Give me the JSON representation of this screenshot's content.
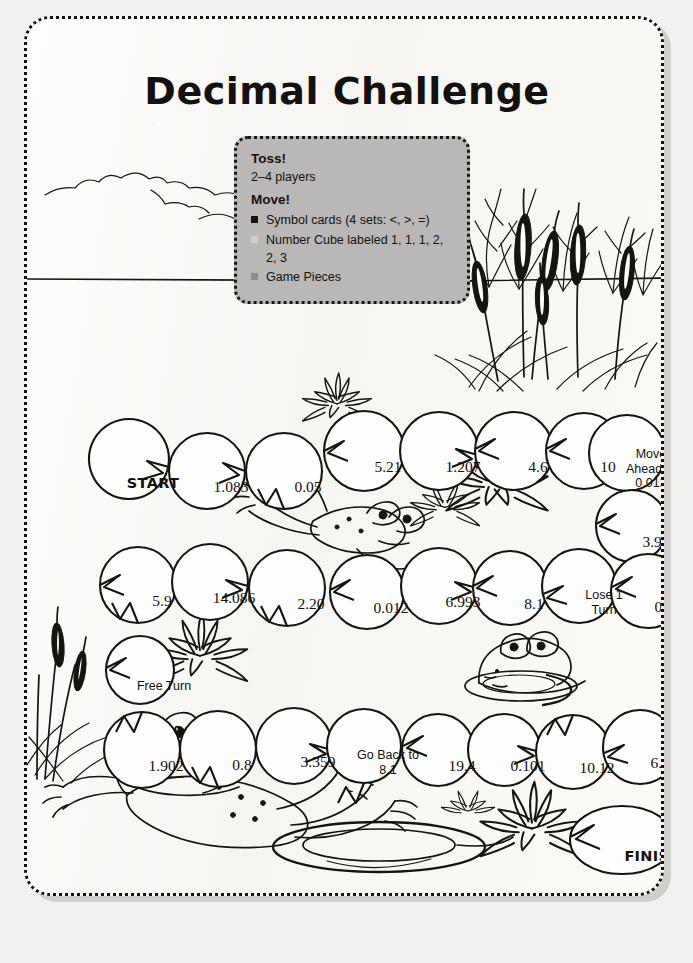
{
  "page": {
    "title": "Decimal Challenge",
    "background_color": "#f2f1ef",
    "sheet_color": "#fbfbf9",
    "ink_color": "#17130f"
  },
  "rules_box": {
    "accent_color": "#b9b8b6",
    "toss_heading": "Toss!",
    "players": "2–4 players",
    "move_heading": "Move!",
    "items": [
      {
        "icon": "square-bullet-dark",
        "text": "Symbol cards (4 sets: <, >, =)"
      },
      {
        "icon": "square-bullet-light",
        "text": "Number Cube labeled 1, 1, 1, 2, 2, 3"
      },
      {
        "icon": "square-bullet-grey",
        "text": "Game Pieces"
      }
    ]
  },
  "board": {
    "start_label": "START",
    "finish_label": "FINISH",
    "rows": [
      {
        "name": "row-1",
        "spaces": [
          {
            "label": "START",
            "kind": "start",
            "x": 102,
            "y": 448
          },
          {
            "label": "1.083",
            "kind": "number",
            "x": 180,
            "y": 452
          },
          {
            "label": "0.05",
            "kind": "number",
            "x": 257,
            "y": 452
          },
          {
            "label": "5.21",
            "kind": "number",
            "x": 337,
            "y": 432
          },
          {
            "label": "1.207",
            "kind": "number",
            "x": 412,
            "y": 432
          },
          {
            "label": "4.6",
            "kind": "number",
            "x": 487,
            "y": 432
          },
          {
            "label": "10",
            "kind": "number",
            "x": 557,
            "y": 432
          },
          {
            "label": "Move Ahead to 0.012",
            "kind": "instruction",
            "x": 624,
            "y": 434
          },
          {
            "label": "3.97",
            "kind": "number",
            "x": 627,
            "y": 507
          }
        ]
      },
      {
        "name": "row-2",
        "spaces": [
          {
            "label": "5.9",
            "kind": "number",
            "x": 111,
            "y": 566
          },
          {
            "label": "14.086",
            "kind": "number",
            "x": 183,
            "y": 563
          },
          {
            "label": "2.20",
            "kind": "number",
            "x": 260,
            "y": 569
          },
          {
            "label": "0.012",
            "kind": "number",
            "x": 340,
            "y": 573
          },
          {
            "label": "6.993",
            "kind": "number",
            "x": 412,
            "y": 567
          },
          {
            "label": "8.1",
            "kind": "number",
            "x": 483,
            "y": 569
          },
          {
            "label": "Lose 1 Turn",
            "kind": "instruction",
            "x": 552,
            "y": 567
          },
          {
            "label": "0.003",
            "kind": "number",
            "x": 621,
            "y": 572
          },
          {
            "label": "Free Turn",
            "kind": "instruction",
            "x": 113,
            "y": 651
          }
        ]
      },
      {
        "name": "row-3",
        "spaces": [
          {
            "label": "1.902",
            "kind": "number",
            "x": 115,
            "y": 731
          },
          {
            "label": "0.8",
            "kind": "number",
            "x": 191,
            "y": 730
          },
          {
            "label": "3.359",
            "kind": "number",
            "x": 267,
            "y": 727
          },
          {
            "label": "Go Back to 8.1",
            "kind": "instruction",
            "x": 337,
            "y": 727
          },
          {
            "label": "19.4",
            "kind": "number",
            "x": 411,
            "y": 731
          },
          {
            "label": "0.101",
            "kind": "number",
            "x": 477,
            "y": 731
          },
          {
            "label": "10.12",
            "kind": "number",
            "x": 546,
            "y": 733
          },
          {
            "label": "6.67",
            "kind": "number",
            "x": 613,
            "y": 728
          },
          {
            "label": "FINISH",
            "kind": "finish",
            "x": 602,
            "y": 821
          }
        ]
      }
    ]
  },
  "scenery": {
    "clouds": "cloud-outline",
    "horizon": "horizon-line",
    "cattails": "cattail-reeds",
    "lily_flowers": "water-lily-blossoms",
    "frog_leaping": "leaping-frog",
    "frog_peeking": "frog-head-in-water",
    "frog_large": "large-frog-swimming",
    "ripples": "water-ripples"
  }
}
